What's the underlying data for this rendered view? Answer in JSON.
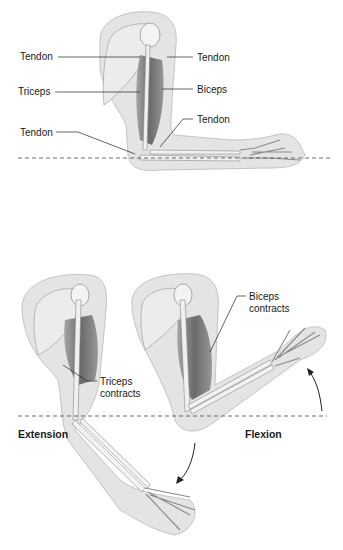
{
  "top_figure": {
    "labels": {
      "tendon_upper_left": "Tendon",
      "tendon_upper_right": "Tendon",
      "triceps": "Triceps",
      "biceps": "Biceps",
      "tendon_lower_right": "Tendon",
      "tendon_lower_left": "Tendon"
    }
  },
  "bottom_figure": {
    "labels": {
      "biceps_contracts_line1": "Biceps",
      "biceps_contracts_line2": "contracts",
      "triceps_contracts_line1": "Triceps",
      "triceps_contracts_line2": "contracts",
      "extension": "Extension",
      "flexion": "Flexion"
    }
  },
  "colors": {
    "skin": "#e3e3e3",
    "skin_outline": "#b5b5b5",
    "bone": "#f2f2f2",
    "bone_outline": "#8a8a8a",
    "muscle": "#6e6e6e",
    "leader_line": "#222222",
    "reference_line": "#444444"
  }
}
